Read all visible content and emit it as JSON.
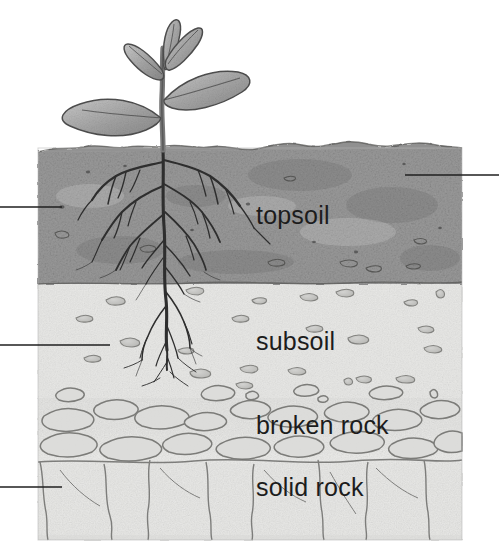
{
  "figure": {
    "background_color": "#ffffff",
    "block": {
      "x": 37,
      "y": 142,
      "width": 426,
      "height": 398
    }
  },
  "labels": {
    "topsoil": "topsoil",
    "subsoil": "subsoil",
    "broken_rock": "broken rock",
    "solid_rock": "solid rock"
  },
  "layers": [
    {
      "name": "topsoil",
      "label": "topsoil",
      "fill": "#9a9a9a",
      "top": 146,
      "bottom": 284,
      "label_x": 256,
      "label_y": 224
    },
    {
      "name": "subsoil",
      "label": "subsoil",
      "fill": "#e7e7e5",
      "top": 284,
      "bottom": 400,
      "label_x": 256,
      "label_y": 350
    },
    {
      "name": "broken-rock",
      "label": "broken rock",
      "fill": "#e2e2e0",
      "top": 400,
      "bottom": 462,
      "label_x": 256,
      "label_y": 434
    },
    {
      "name": "solid-rock",
      "label": "solid rock",
      "fill": "#e4e4e2",
      "top": 462,
      "bottom": 540,
      "label_x": 256,
      "label_y": 496
    }
  ],
  "leader_lines": [
    {
      "name": "topsoil-leader-right",
      "side": "right",
      "x1": 405,
      "x2": 499,
      "y": 175
    },
    {
      "name": "topsoil-leader-left",
      "side": "left",
      "x1": 0,
      "x2": 62,
      "y": 207
    },
    {
      "name": "subsoil-leader-left",
      "side": "left",
      "x1": 0,
      "x2": 110,
      "y": 345
    },
    {
      "name": "solid-rock-leader-left",
      "side": "left",
      "x1": 0,
      "x2": 62,
      "y": 487
    }
  ],
  "plant": {
    "name": "seedling",
    "stem_x": 163,
    "stem_top": 42,
    "stem_bottom": 160,
    "leaf_count": 5,
    "color": "#8e8e8e"
  },
  "colors": {
    "ink": "#3b3b3b",
    "topsoil": "#9a9a9a",
    "subsoil": "#e7e7e5",
    "rock_outline": "#7d7d7a",
    "crack": "#6f6f6f",
    "leader_line": "#222222",
    "label_text": "#1c1c1c"
  }
}
